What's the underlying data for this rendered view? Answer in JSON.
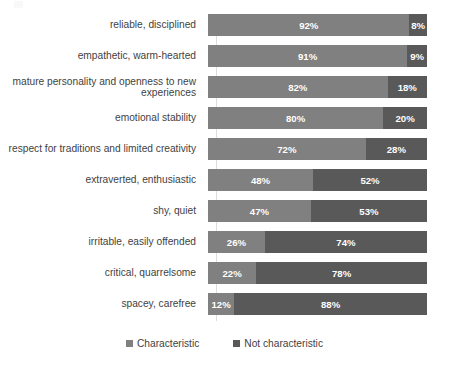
{
  "chart_data": {
    "type": "bar",
    "subtype": "stacked-horizontal-100pct",
    "title": "",
    "xlabel": "",
    "ylabel": "",
    "xlim": [
      0,
      100
    ],
    "grid": false,
    "legend_position": "bottom",
    "categories": [
      "reliable, disciplined",
      "empathetic, warm-hearted",
      "mature personality and openness to new experiences",
      "emotional stability",
      "respect for traditions and limited creativity",
      "extraverted, enthusiastic",
      "shy, quiet",
      "irritable, easily offended",
      "critical, quarrelsome",
      "spacey, carefree"
    ],
    "series": [
      {
        "name": "Characteristic",
        "color": "#808080",
        "values": [
          92,
          91,
          82,
          80,
          72,
          48,
          47,
          26,
          22,
          12
        ],
        "labels": [
          "92%",
          "91%",
          "82%",
          "80%",
          "72%",
          "48%",
          "47%",
          "26%",
          "22%",
          "12%"
        ]
      },
      {
        "name": "Not characteristic",
        "color": "#595959",
        "values": [
          8,
          9,
          18,
          20,
          28,
          52,
          53,
          74,
          78,
          88
        ],
        "labels": [
          "8%",
          "9%",
          "18%",
          "20%",
          "28%",
          "52%",
          "53%",
          "74%",
          "78%",
          "88%"
        ]
      }
    ]
  },
  "legend": {
    "items": [
      {
        "label": "Characteristic",
        "color": "#808080"
      },
      {
        "label": "Not characteristic",
        "color": "#595959"
      }
    ]
  }
}
